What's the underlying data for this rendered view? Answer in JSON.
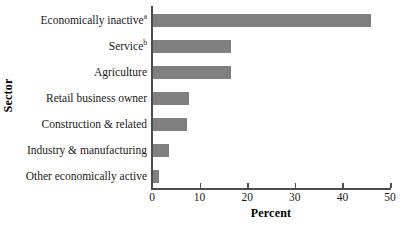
{
  "chart_data": {
    "type": "bar",
    "orientation": "horizontal",
    "title": "",
    "xlabel": "Percent",
    "ylabel": "Sector",
    "xlim": [
      0,
      50
    ],
    "xticks": [
      0,
      10,
      20,
      30,
      40,
      50
    ],
    "xtick_labels": [
      "0",
      "10",
      "20",
      "30",
      "40",
      "50"
    ],
    "grid": false,
    "legend": false,
    "bar_color": "#808080",
    "axis_color": "#4d4d4d",
    "categories": [
      "Economically inactive",
      "Service",
      "Agriculture",
      "Retail business owner",
      "Construction & related",
      "Industry & manufacturing",
      "Other economically active"
    ],
    "category_footnotes": [
      "a",
      "b",
      "",
      "",
      "",
      "",
      ""
    ],
    "values": [
      46.0,
      16.7,
      16.7,
      7.8,
      7.4,
      3.6,
      1.5
    ]
  }
}
